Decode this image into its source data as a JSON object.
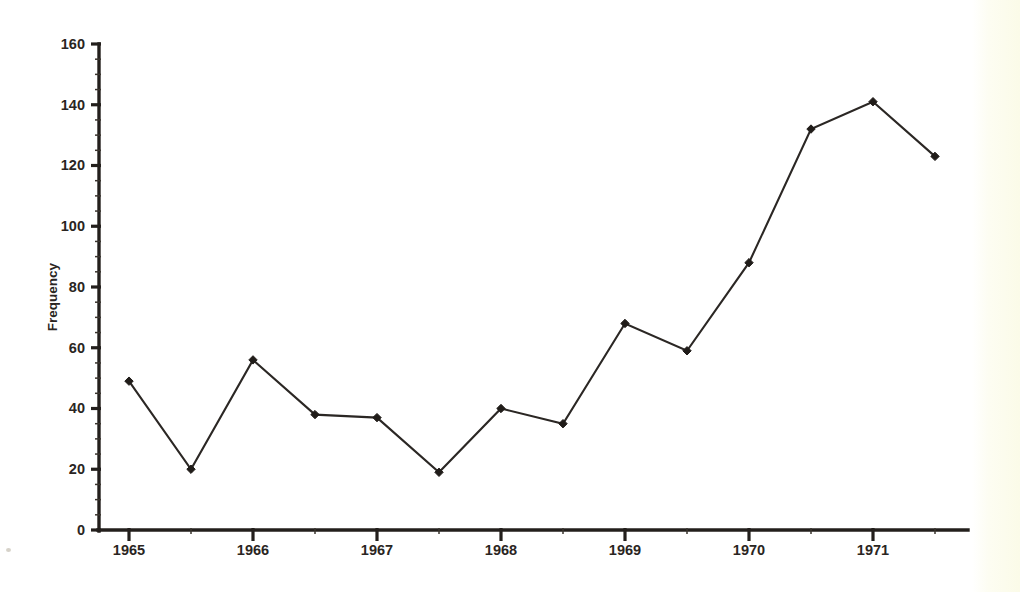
{
  "chart_data": {
    "type": "line",
    "title": "",
    "subtitle": "",
    "xlabel": "",
    "ylabel": "Frequency",
    "grid": false,
    "legend": false,
    "legend_position": "none",
    "marker": "filled-diamond",
    "line_color": "#2b2724",
    "marker_color": "#201c19",
    "background_color": "#ffffff",
    "xlim": [
      0,
      14
    ],
    "ylim": [
      0,
      160
    ],
    "ytick_labels": [
      "0",
      "20",
      "40",
      "60",
      "80",
      "100",
      "120",
      "140",
      "160"
    ],
    "ytick_values": [
      0,
      20,
      40,
      60,
      80,
      100,
      120,
      140,
      160
    ],
    "ytick_minor_step": 5,
    "xtick_labels": [
      "1965",
      "1966",
      "1967",
      "1968",
      "1969",
      "1970",
      "1971"
    ],
    "xtick_values": [
      0,
      2,
      4,
      6,
      8,
      10,
      12
    ],
    "x_indices": [
      0,
      1,
      2,
      3,
      4,
      5,
      6,
      7,
      8,
      9,
      10,
      11,
      12,
      13
    ],
    "values": [
      49,
      20,
      56,
      38,
      37,
      19,
      40,
      35,
      68,
      59,
      88,
      132,
      141,
      123
    ],
    "series": [
      {
        "name": "Frequency",
        "values": [
          49,
          20,
          56,
          38,
          37,
          19,
          40,
          35,
          68,
          59,
          88,
          132,
          141,
          123
        ]
      }
    ],
    "annotations": []
  },
  "axes": {
    "y_title": "Frequency"
  }
}
